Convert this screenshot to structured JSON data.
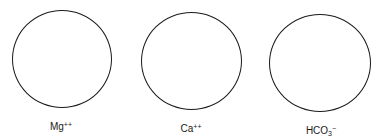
{
  "diagram": {
    "stroke_color": "#1a1a1a",
    "ions": [
      {
        "id": "mg",
        "base": "Mg",
        "subscript": "",
        "superscript": "++",
        "label_full": "Mg++",
        "circle": {
          "left": 12,
          "top": 10,
          "width": 100,
          "height": 98
        },
        "label_pos": {
          "cx": 61,
          "top": 121
        }
      },
      {
        "id": "ca",
        "base": "Ca",
        "subscript": "",
        "superscript": "++",
        "label_full": "Ca++",
        "circle": {
          "left": 141,
          "top": 12,
          "width": 101,
          "height": 98
        },
        "label_pos": {
          "cx": 191,
          "top": 123
        }
      },
      {
        "id": "hco3",
        "base": "HCO",
        "subscript": "3",
        "superscript": "−",
        "label_full": "HCO3−",
        "circle": {
          "left": 269,
          "top": 14,
          "width": 102,
          "height": 98
        },
        "label_pos": {
          "cx": 321,
          "top": 125
        }
      }
    ]
  }
}
